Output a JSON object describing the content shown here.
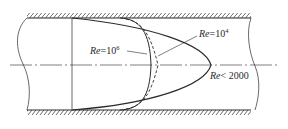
{
  "diagram": {
    "colors": {
      "line": "#2a2a2a",
      "background": "#ffffff"
    },
    "labels": {
      "re_1e6": {
        "prefix": "Re",
        "op": "=10",
        "sup": "6"
      },
      "re_1e4": {
        "prefix": "Re",
        "op": "=10",
        "sup": "4"
      },
      "re_laminar": {
        "prefix": "Re",
        "op": "< 2000",
        "sup": ""
      }
    },
    "elements": [
      "top pipe wall (hatched)",
      "bottom pipe wall (hatched)",
      "centerline (dash-dot)",
      "left break line",
      "right break line",
      "reference vertical line",
      "laminar parabolic profile (Re<2000)",
      "turbulent profile Re=10^6 (solid)",
      "turbulent profile Re=10^4 (dashed)"
    ]
  }
}
